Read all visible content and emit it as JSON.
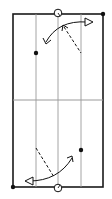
{
  "diagram": {
    "title": "Court drill diagram",
    "colors": {
      "border": "#1a1a1a",
      "lane_line": "#9a9a9a",
      "midline": "#9a9a9a",
      "marker": "#111111",
      "background": "#ffffff"
    },
    "court": {
      "x": 13,
      "y": 14,
      "width": 90,
      "height": 173
    },
    "lane_lines_x": [
      36,
      58,
      81
    ],
    "midline_y": 100,
    "players": [
      {
        "label": "player-top-center",
        "x": 58,
        "y": 13
      },
      {
        "label": "player-bottom-center",
        "x": 58,
        "y": 188
      }
    ],
    "dots": [
      {
        "label": "dot-top-right-corner",
        "x": 103,
        "y": 14
      },
      {
        "label": "dot-top-left-lane",
        "x": 36,
        "y": 53
      },
      {
        "label": "dot-bottom-right-lane",
        "x": 81,
        "y": 150
      },
      {
        "label": "dot-bottom-left-corner",
        "x": 13,
        "y": 187
      }
    ],
    "paths": {
      "top_curve": "M 88 22 Q 58 22 45 44",
      "top_dashed": "M 63 26 L 81 53",
      "bottom_curve": "M 27 181 Q 60 181 72 157",
      "bottom_dashed": "M 36 148 L 54 177"
    }
  }
}
